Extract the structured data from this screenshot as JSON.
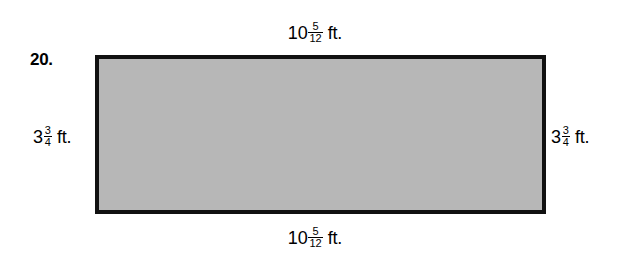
{
  "problem": {
    "number": "20."
  },
  "figure": {
    "shape": "rectangle",
    "fill_color": "#b7b7b7",
    "border_color": "#111111"
  },
  "labels": {
    "top": {
      "whole": "10",
      "numerator": "5",
      "denominator": "12",
      "unit": "ft."
    },
    "bottom": {
      "whole": "10",
      "numerator": "5",
      "denominator": "12",
      "unit": "ft."
    },
    "left": {
      "whole": "3",
      "numerator": "3",
      "denominator": "4",
      "unit": "ft."
    },
    "right": {
      "whole": "3",
      "numerator": "3",
      "denominator": "4",
      "unit": "ft."
    }
  }
}
